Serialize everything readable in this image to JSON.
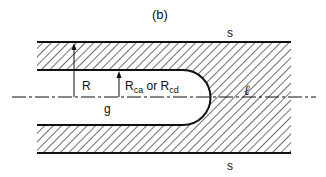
{
  "figure": {
    "panel_label": "(b)",
    "labels": {
      "top_surface": "s",
      "bottom_surface": "s",
      "radius_outer": "R",
      "radius_inner_prefix": "R",
      "radius_inner_sub1": "ca",
      "radius_inner_or": " or ",
      "radius_inner_prefix2": "R",
      "radius_inner_sub2": "cd",
      "gap": "g",
      "axis": "ℓ"
    },
    "colors": {
      "line": "#111111",
      "hatch": "#222222",
      "background": "#ffffff"
    }
  }
}
